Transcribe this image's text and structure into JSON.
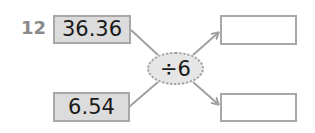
{
  "question": {
    "number": "12"
  },
  "inputs": [
    {
      "value": "36.36"
    },
    {
      "value": "6.54"
    }
  ],
  "operation": {
    "label": "÷6"
  },
  "outputs": [
    {
      "value": ""
    },
    {
      "value": ""
    }
  ],
  "colors": {
    "given_fill": "#dcdcdc",
    "border": "#a8a8a8",
    "arrow": "#a0a0a0",
    "op_fill": "#e6e6e6"
  }
}
